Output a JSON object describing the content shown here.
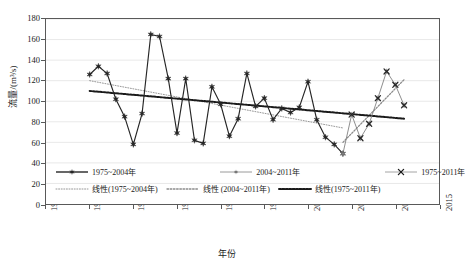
{
  "chart_data": {
    "type": "line",
    "title": "",
    "xlabel": "年份",
    "ylabel": "流量/(m³/s)",
    "xlim": [
      1970,
      2015
    ],
    "ylim": [
      0,
      180
    ],
    "xticks": [
      1970,
      1975,
      1980,
      1985,
      1990,
      1995,
      2000,
      2005,
      2010,
      2015
    ],
    "yticks": [
      0,
      20,
      40,
      60,
      80,
      100,
      120,
      140,
      160,
      180
    ],
    "grid": "horizontal",
    "legend_position": "inside-bottom",
    "series": [
      {
        "name": "1975~2004年",
        "marker": "filled-star",
        "color": "#262626",
        "x": [
          1975,
          1976,
          1977,
          1978,
          1979,
          1980,
          1981,
          1982,
          1983,
          1984,
          1985,
          1986,
          1987,
          1988,
          1989,
          1990,
          1991,
          1992,
          1993,
          1994,
          1995,
          1996,
          1997,
          1998,
          1999,
          2000,
          2001,
          2002,
          2003,
          2004
        ],
        "values": [
          126,
          134,
          127,
          102,
          85,
          58,
          88,
          165,
          163,
          122,
          69,
          122,
          62,
          59,
          114,
          97,
          66,
          83,
          127,
          95,
          103,
          82,
          93,
          89,
          94,
          119,
          82,
          65,
          58,
          49
        ]
      },
      {
        "name": "2004~2011年",
        "marker": "filled-star-gray",
        "color": "#808080",
        "x": [
          2004,
          2005,
          2006,
          2007,
          2008,
          2009,
          2010,
          2011
        ],
        "values": [
          49,
          87,
          64,
          78,
          103,
          129,
          116,
          96
        ]
      },
      {
        "name": "1975~2011年",
        "marker": "x",
        "color": "#262626",
        "x": [
          2005,
          2006,
          2007,
          2008,
          2009,
          2010,
          2011
        ],
        "values": [
          87,
          64,
          78,
          103,
          129,
          116,
          96
        ]
      }
    ],
    "trendlines": [
      {
        "name": "线性(1975~2004年)",
        "style": "fine-dotted-gray",
        "color": "#8c8c8c",
        "x": [
          1975,
          2004
        ],
        "values": [
          120,
          74
        ]
      },
      {
        "name": "线性 (2004~2011年)",
        "style": "dotted-gray",
        "color": "#8c8c8c",
        "x": [
          2004,
          2011
        ],
        "values": [
          60,
          121
        ]
      },
      {
        "name": "线性(1975~2011年)",
        "style": "bold-dotted-black",
        "color": "#1a1a1a",
        "x": [
          1975,
          2011
        ],
        "values": [
          110,
          83
        ]
      }
    ]
  },
  "legend": {
    "row1": [
      {
        "label": "1975~2004年",
        "symbol": "line-star-black"
      },
      {
        "label": "2004~2011年",
        "symbol": "line-dot-gray"
      },
      {
        "label": "1975~2011年",
        "symbol": "line-x-black"
      }
    ],
    "row2": [
      {
        "label": "线性(1975~2004年)",
        "symbol": "fine-dotted-gray"
      },
      {
        "label": "线性 (2004~2011年)",
        "symbol": "dotted-gray"
      },
      {
        "label": "线性(1975~2011年)",
        "symbol": "bold-dotted-black"
      }
    ]
  }
}
